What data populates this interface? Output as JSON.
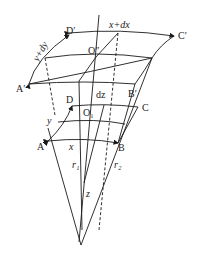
{
  "diagram": {
    "type": "geometric-element-curvilinear-coordinates",
    "labels": {
      "A_prime": "A′",
      "B_prime": "B′",
      "C_prime": "C′",
      "D_prime": "D′",
      "O_dprime": "O″",
      "x_plus_dx": "x+dx",
      "y_plus_dy": "y+dy",
      "dz": "dz",
      "A": "A",
      "B": "B",
      "C": "C",
      "D": "D",
      "O1": "O₁",
      "x": "x",
      "y": "y",
      "r1": "r₁",
      "r2": "r₂",
      "z": "z"
    },
    "colors": {
      "stroke": "#1a1a1a",
      "background": "#ffffff"
    }
  }
}
